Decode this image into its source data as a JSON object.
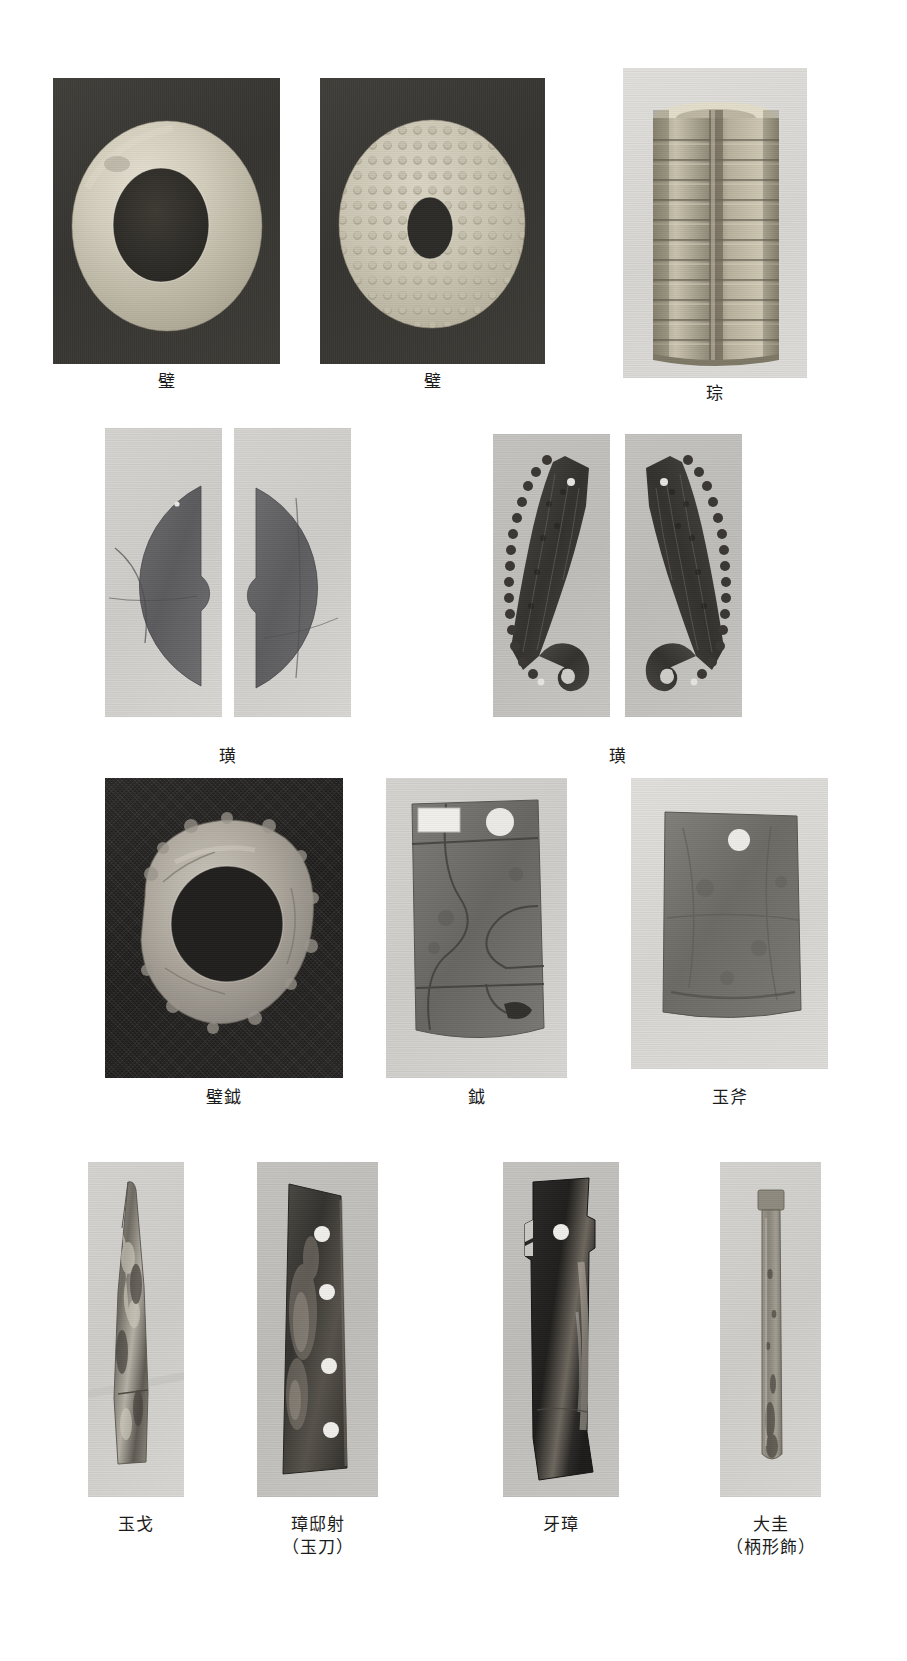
{
  "page": {
    "type": "photographic-plate",
    "background_color": "#ffffff",
    "width": 907,
    "height": 1661
  },
  "rows": [
    {
      "row_index": 1,
      "figures": [
        {
          "id": "fig-bi-plain",
          "caption": "璧",
          "caption_sub": "",
          "photo_background": "#332f2b",
          "object_color": "#c9c4b4",
          "shape": "annular-disc",
          "frame": {
            "x": 53,
            "y": 78,
            "w": 227,
            "h": 286
          },
          "caption_pos": {
            "x": 53,
            "y": 370,
            "w": 227
          }
        },
        {
          "id": "fig-bi-bossed",
          "caption": "璧",
          "caption_sub": "",
          "photo_background": "#322e2a",
          "object_color": "#c2bda9",
          "shape": "bossed-disc",
          "frame": {
            "x": 320,
            "y": 78,
            "w": 225,
            "h": 286
          },
          "caption_pos": {
            "x": 320,
            "y": 370,
            "w": 225
          }
        },
        {
          "id": "fig-cong",
          "caption": "琮",
          "caption_sub": "",
          "photo_background": "#b9b8b4",
          "object_color": "#b3ab97",
          "shape": "tube-prism",
          "frame": {
            "x": 623,
            "y": 68,
            "w": 184,
            "h": 310
          },
          "caption_pos": {
            "x": 623,
            "y": 382,
            "w": 184
          }
        }
      ]
    },
    {
      "row_index": 2,
      "figures": [
        {
          "id": "fig-huang-a1",
          "caption": "",
          "caption_sub": "",
          "photo_background": "#d9d8d4",
          "object_color": "#57565a",
          "shape": "half-disc-left",
          "frame": {
            "x": 105,
            "y": 428,
            "w": 117,
            "h": 289
          },
          "caption_pos": null
        },
        {
          "id": "fig-huang-a2",
          "caption": "璜",
          "caption_sub": "",
          "photo_background": "#d9d8d4",
          "object_color": "#57565a",
          "shape": "half-disc-right",
          "frame": {
            "x": 234,
            "y": 428,
            "w": 117,
            "h": 289
          },
          "caption_pos": {
            "x": 105,
            "y": 745,
            "w": 246
          }
        },
        {
          "id": "fig-huang-b1",
          "caption": "",
          "caption_sub": "",
          "photo_background": "#c3c2be",
          "object_color": "#3b3936",
          "shape": "carved-arc",
          "frame": {
            "x": 493,
            "y": 434,
            "w": 117,
            "h": 283
          },
          "caption_pos": null
        },
        {
          "id": "fig-huang-b2",
          "caption": "璜",
          "caption_sub": "",
          "photo_background": "#c3c2be",
          "object_color": "#3b3936",
          "shape": "carved-arc-mirror",
          "frame": {
            "x": 625,
            "y": 434,
            "w": 117,
            "h": 283
          },
          "caption_pos": {
            "x": 493,
            "y": 745,
            "w": 249
          }
        }
      ]
    },
    {
      "row_index": 3,
      "figures": [
        {
          "id": "fig-bi-yue",
          "caption": "璧鉞",
          "caption_sub": "",
          "photo_background": "#1f1e1c",
          "object_color": "#a9a49a",
          "shape": "irregular-ring",
          "frame": {
            "x": 105,
            "y": 778,
            "w": 238,
            "h": 300
          },
          "caption_pos": {
            "x": 105,
            "y": 1086,
            "w": 238
          }
        },
        {
          "id": "fig-yue",
          "caption": "鉞",
          "caption_sub": "",
          "photo_background": "#d3d2ce",
          "object_color": "#6a6866",
          "shape": "axe-blade-fragmented",
          "frame": {
            "x": 386,
            "y": 778,
            "w": 181,
            "h": 300
          },
          "caption_pos": {
            "x": 386,
            "y": 1086,
            "w": 181
          }
        },
        {
          "id": "fig-yu-fu",
          "caption": "玉斧",
          "caption_sub": "",
          "photo_background": "#dbdad7",
          "object_color": "#6e6c67",
          "shape": "jade-axe-rect",
          "frame": {
            "x": 631,
            "y": 778,
            "w": 197,
            "h": 291
          },
          "caption_pos": {
            "x": 631,
            "y": 1086,
            "w": 197
          }
        }
      ]
    },
    {
      "row_index": 4,
      "figures": [
        {
          "id": "fig-yu-ge",
          "caption": "玉戈",
          "caption_sub": "",
          "photo_background": "#d6d5d1",
          "object_color": "#8b8880",
          "shape": "dagger-axe",
          "frame": {
            "x": 88,
            "y": 1162,
            "w": 96,
            "h": 335
          },
          "caption_pos": {
            "x": 88,
            "y": 1513,
            "w": 96
          }
        },
        {
          "id": "fig-zhang-dishe",
          "caption": "璋邸射",
          "caption_sub": "（玉刀）",
          "photo_background": "#cecdc9",
          "object_color": "#3c3a36",
          "shape": "perforated-blade",
          "frame": {
            "x": 257,
            "y": 1162,
            "w": 121,
            "h": 335
          },
          "caption_pos": {
            "x": 257,
            "y": 1513,
            "w": 121
          }
        },
        {
          "id": "fig-ya-zhang",
          "caption": "牙璋",
          "caption_sub": "",
          "photo_background": "#cdccc8",
          "object_color": "#2d2b28",
          "shape": "notched-blade",
          "frame": {
            "x": 503,
            "y": 1162,
            "w": 116,
            "h": 335
          },
          "caption_pos": {
            "x": 503,
            "y": 1513,
            "w": 116
          }
        },
        {
          "id": "fig-da-gui",
          "caption": "大圭",
          "caption_sub": "（柄形飾）",
          "photo_background": "#d4d3cf",
          "object_color": "#8f8b80",
          "shape": "slender-baton",
          "frame": {
            "x": 720,
            "y": 1162,
            "w": 101,
            "h": 335
          },
          "caption_pos": {
            "x": 720,
            "y": 1513,
            "w": 101
          }
        }
      ]
    }
  ],
  "colors": {
    "page_background": "#ffffff",
    "caption_text": "#1b1b1b",
    "dark_photo_bg": "#332f2b",
    "light_photo_bg": "#d6d5d1"
  }
}
